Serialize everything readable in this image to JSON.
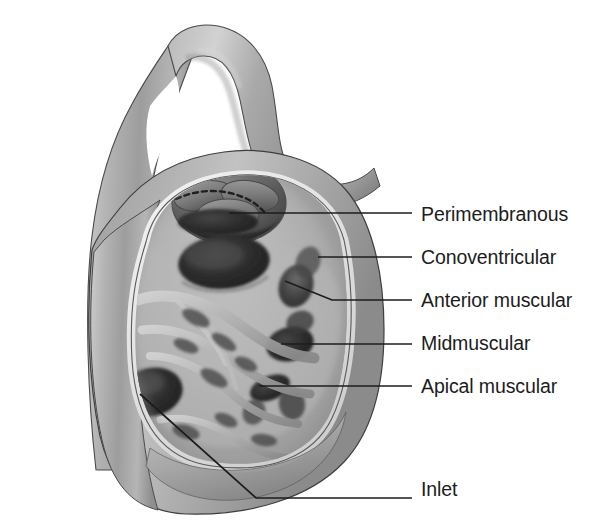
{
  "figure": {
    "background_color": "#ffffff",
    "leader_line_color": "#1c1c1c",
    "label_color": "#1c1c1c",
    "palette": {
      "myocardium_light": "#d8d8d8",
      "myocardium_mid": "#a8a8a8",
      "myocardium_dark": "#7d7d7d",
      "endocardium_highlight": "#f0f0f0",
      "defect_dark": "#2a2a2a",
      "defect_shadow": "#4a4a4a",
      "outline": "#3a3a3a"
    }
  },
  "labels": [
    {
      "id": "perimembranous",
      "text": "Perimembranous",
      "x": 421,
      "y": 205
    },
    {
      "id": "conoventricular",
      "text": "Conoventricular",
      "x": 421,
      "y": 248
    },
    {
      "id": "anterior-muscular",
      "text": "Anterior muscular",
      "x": 421,
      "y": 291
    },
    {
      "id": "midmuscular",
      "text": "Midmuscular",
      "x": 421,
      "y": 334
    },
    {
      "id": "apical-muscular",
      "text": "Apical muscular",
      "x": 421,
      "y": 377
    },
    {
      "id": "inlet",
      "text": "Inlet",
      "x": 421,
      "y": 480
    }
  ],
  "leaders": [
    {
      "id": "perimembranous",
      "points": "229,213 412,213"
    },
    {
      "id": "conoventricular",
      "points": "318,257 412,257"
    },
    {
      "id": "anterior-muscular",
      "points": "285,281 332,300 412,300"
    },
    {
      "id": "midmuscular",
      "points": "281,344 412,344"
    },
    {
      "id": "apical-muscular",
      "points": "259,386 412,386"
    },
    {
      "id": "inlet",
      "points": "140,394 256,498 412,498"
    }
  ],
  "caption": {
    "text": "",
    "visible": false
  }
}
